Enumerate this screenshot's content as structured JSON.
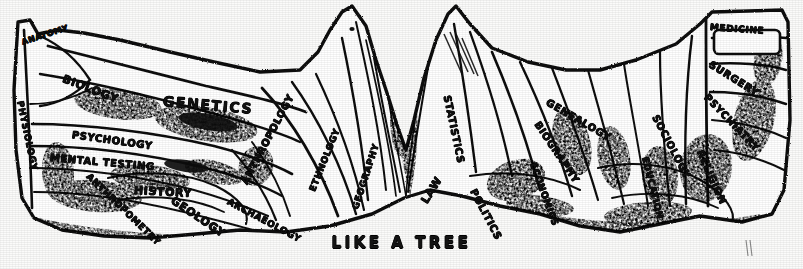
{
  "figure": {
    "caption": "LIKE A TREE",
    "ink_color": "#111111",
    "paper_color": "#fbfbfa"
  },
  "labels": {
    "left_canopy": [
      {
        "id": "anatomy",
        "text": "ANATOMY",
        "x": 22,
        "y": 38,
        "rot": -18,
        "size": 8
      },
      {
        "id": "physiology",
        "text": "PHYSIOLOGY",
        "x": 20,
        "y": 96,
        "rot": 78,
        "size": 9
      },
      {
        "id": "biology",
        "text": "BIOLOGY",
        "x": 63,
        "y": 72,
        "rot": 21,
        "size": 11
      },
      {
        "id": "genetics",
        "text": "GENETICS",
        "x": 163,
        "y": 93,
        "rot": 5,
        "size": 14
      },
      {
        "id": "psychology",
        "text": "PSYCHOLOGY",
        "x": 72,
        "y": 129,
        "rot": 8,
        "size": 10
      },
      {
        "id": "mental-testing",
        "text": "MENTAL TESTING",
        "x": 50,
        "y": 152,
        "rot": 5,
        "size": 10
      },
      {
        "id": "anthropometry",
        "text": "ANTHROPOMETRY",
        "x": 88,
        "y": 170,
        "rot": 44,
        "size": 9
      },
      {
        "id": "history",
        "text": "HISTORY",
        "x": 134,
        "y": 184,
        "rot": 3,
        "size": 11
      },
      {
        "id": "geology",
        "text": "GEOLOGY",
        "x": 172,
        "y": 193,
        "rot": 34,
        "size": 11
      },
      {
        "id": "archaeology",
        "text": "ARCHAEOLOGY",
        "x": 228,
        "y": 196,
        "rot": 28,
        "size": 9
      },
      {
        "id": "anthropology",
        "text": "ANTHROPOLOGY",
        "x": 244,
        "y": 178,
        "rot": -62,
        "size": 10
      },
      {
        "id": "ethnology",
        "text": "ETHNOLOGY",
        "x": 312,
        "y": 186,
        "rot": -68,
        "size": 9
      },
      {
        "id": "geography",
        "text": "GEOGRAPHY",
        "x": 355,
        "y": 204,
        "rot": -72,
        "size": 9
      }
    ],
    "right_canopy": [
      {
        "id": "law",
        "text": "LAW",
        "x": 424,
        "y": 196,
        "rot": -58,
        "size": 11
      },
      {
        "id": "statistics",
        "text": "STATISTICS",
        "x": 447,
        "y": 90,
        "rot": 78,
        "size": 10
      },
      {
        "id": "politics",
        "text": "POLITICS",
        "x": 473,
        "y": 184,
        "rot": 62,
        "size": 10
      },
      {
        "id": "economics",
        "text": "ECONOMICS",
        "x": 533,
        "y": 158,
        "rot": 70,
        "size": 9
      },
      {
        "id": "biography",
        "text": "BIOGRAPHY",
        "x": 537,
        "y": 117,
        "rot": 56,
        "size": 10
      },
      {
        "id": "genealogy",
        "text": "GENEALOGY",
        "x": 547,
        "y": 96,
        "rot": 30,
        "size": 10
      },
      {
        "id": "sociology",
        "text": "SOCIOLOGY",
        "x": 655,
        "y": 110,
        "rot": 62,
        "size": 10
      },
      {
        "id": "education",
        "text": "EDUCATION",
        "x": 645,
        "y": 152,
        "rot": 76,
        "size": 9
      },
      {
        "id": "religion",
        "text": "RELIGION",
        "x": 700,
        "y": 145,
        "rot": 66,
        "size": 10
      },
      {
        "id": "medicine",
        "text": "MEDICINE",
        "x": 710,
        "y": 22,
        "rot": 4,
        "size": 9
      },
      {
        "id": "surgery",
        "text": "SURGERY",
        "x": 710,
        "y": 58,
        "rot": 32,
        "size": 10
      },
      {
        "id": "psychiatry",
        "text": "PSYCHIATRY",
        "x": 706,
        "y": 90,
        "rot": 46,
        "size": 10
      }
    ]
  }
}
